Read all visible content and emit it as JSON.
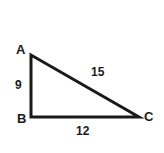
{
  "figure": {
    "type": "right-triangle-diagram",
    "background_color": "#ffffff",
    "stroke_color": "#1a1a1a",
    "text_color": "#1a1a1a",
    "vertices": {
      "a": {
        "label": "A",
        "x": 31,
        "y": 55
      },
      "b": {
        "label": "B",
        "x": 31,
        "y": 117
      },
      "c": {
        "label": "C",
        "x": 139,
        "y": 117
      }
    },
    "sides": {
      "ab": {
        "label": "9",
        "value": 9,
        "from": "A",
        "to": "B"
      },
      "bc": {
        "label": "12",
        "value": 12,
        "from": "B",
        "to": "C"
      },
      "ac": {
        "label": "15",
        "value": 15,
        "from": "A",
        "to": "C"
      }
    }
  }
}
